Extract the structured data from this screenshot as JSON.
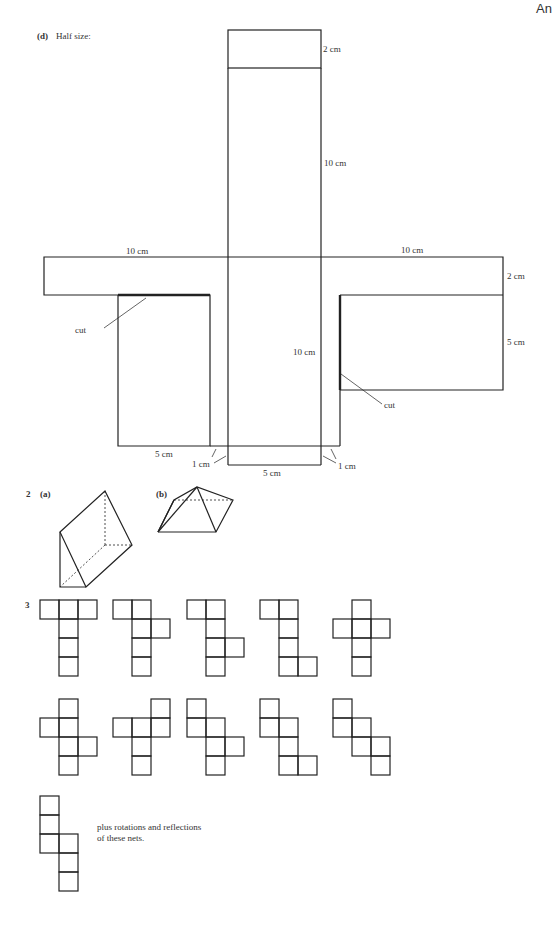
{
  "header": {
    "corner_text": "An"
  },
  "part_d": {
    "label": "(d)",
    "title": "Half size:",
    "dims": {
      "top_flap": "2 cm",
      "top_panel": "10 cm",
      "left_arm": "10 cm",
      "right_arm": "10 cm",
      "right_arm_height": "2 cm",
      "right_panel_height": "5 cm",
      "center_panel": "10 cm",
      "left_panel_width": "5 cm",
      "bottom_flap_width": "5 cm",
      "left_gap": "1 cm",
      "right_gap": "1 cm"
    },
    "cut_left": "cut",
    "cut_right": "cut"
  },
  "question_2": {
    "number": "2",
    "part_a": "(a)",
    "part_b": "(b)"
  },
  "question_3": {
    "number": "3",
    "note_line1": "plus rotations and reflections",
    "note_line2": "of these nets."
  }
}
